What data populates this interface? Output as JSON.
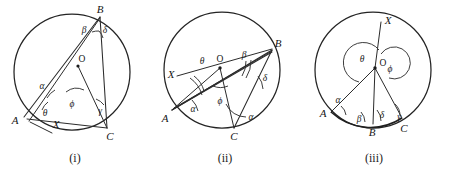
{
  "sheet": {
    "title": "Circle theorem angle diagrams",
    "background_color": "#ffffff",
    "ink_color": "#242424"
  },
  "figures": [
    {
      "id": "i",
      "caption": "(i)",
      "description": "Circle with centre O, chord AB and chord BC drawn, line from A through O extended, marked angles alpha, beta, gamma, delta, theta, phi, and ray X",
      "center_label": "O",
      "vertices": [
        {
          "name": "B",
          "label": "B"
        },
        {
          "name": "A",
          "label": "A"
        },
        {
          "name": "C",
          "label": "C"
        },
        {
          "name": "X",
          "label": "X"
        }
      ],
      "angles": [
        {
          "name": "beta",
          "label": "β"
        },
        {
          "name": "delta",
          "label": "δ"
        },
        {
          "name": "alpha",
          "label": "α"
        },
        {
          "name": "theta",
          "label": "θ"
        },
        {
          "name": "phi",
          "label": "ϕ"
        },
        {
          "name": "gamma",
          "label": "γ"
        }
      ]
    },
    {
      "id": "ii",
      "caption": "(ii)",
      "description": "Circle with centre O, chords AB and BC, line X through O to B, marked angles theta, beta, delta, alpha, phi and a second alpha at C",
      "center_label": "O",
      "vertices": [
        {
          "name": "B",
          "label": "B"
        },
        {
          "name": "A",
          "label": "A"
        },
        {
          "name": "C",
          "label": "C"
        },
        {
          "name": "X",
          "label": "X"
        }
      ],
      "angles": [
        {
          "name": "theta",
          "label": "θ"
        },
        {
          "name": "beta",
          "label": "β"
        },
        {
          "name": "delta",
          "label": "δ"
        },
        {
          "name": "alpha",
          "label": "α"
        },
        {
          "name": "phi",
          "label": "ϕ"
        },
        {
          "name": "alpha-c",
          "label": "α"
        }
      ]
    },
    {
      "id": "iii",
      "caption": "(iii)",
      "description": "Circle with centre O, radii to A, B and C on the lower arc, vertical ray X upward from O, reflex angle theta and angle phi at centre, angles alpha, beta, delta, gamma on the arc",
      "center_label": "O",
      "vertices": [
        {
          "name": "X",
          "label": "X"
        },
        {
          "name": "A",
          "label": "A"
        },
        {
          "name": "B",
          "label": "B"
        },
        {
          "name": "C",
          "label": "C"
        }
      ],
      "angles": [
        {
          "name": "theta",
          "label": "θ"
        },
        {
          "name": "phi",
          "label": "ϕ"
        },
        {
          "name": "alpha",
          "label": "α"
        },
        {
          "name": "beta",
          "label": "β"
        },
        {
          "name": "delta",
          "label": "δ"
        },
        {
          "name": "gamma",
          "label": "γ"
        }
      ]
    }
  ]
}
